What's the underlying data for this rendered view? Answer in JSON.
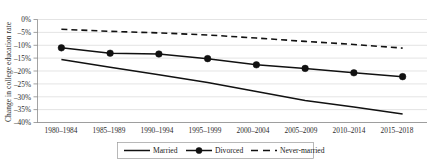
{
  "chart_data": {
    "type": "line",
    "title": "",
    "xlabel": "",
    "ylabel": "Change in college education rate",
    "categories": [
      "1980–1984",
      "1985–1989",
      "1990–1994",
      "1995–1999",
      "2000–2004",
      "2005–2009",
      "2010–2014",
      "2015–2018"
    ],
    "series": [
      {
        "name": "Married",
        "style": "solid",
        "markers": false,
        "values": [
          -15.5,
          -18.5,
          -21.5,
          -24.5,
          -28.0,
          -31.5,
          -34.0,
          -36.7
        ]
      },
      {
        "name": "Divorced",
        "style": "solid",
        "markers": true,
        "values": [
          -11.0,
          -13.1,
          -13.4,
          -15.2,
          -17.6,
          -19.0,
          -20.7,
          -22.2
        ]
      },
      {
        "name": "Never-married",
        "style": "dashed",
        "markers": false,
        "values": [
          -3.8,
          -4.6,
          -5.2,
          -6.0,
          -7.2,
          -8.5,
          -9.7,
          -11.1
        ]
      }
    ],
    "ylim": [
      -40,
      0
    ],
    "ytick_labels": [
      "0%",
      "–5%",
      "–10%",
      "–15%",
      "–20%",
      "–25%",
      "–30%",
      "–35%",
      "–40%"
    ],
    "ytick_values": [
      0,
      -5,
      -10,
      -15,
      -20,
      -25,
      -30,
      -35,
      -40
    ],
    "grid": true,
    "legend_position": "bottom",
    "legend": [
      "Married",
      "Divorced",
      "Never-married"
    ],
    "colors": {
      "series": "#111111",
      "gridline": "#d9d9d9",
      "axis": "#8c8c8c",
      "text": "#1a1a1a"
    }
  }
}
